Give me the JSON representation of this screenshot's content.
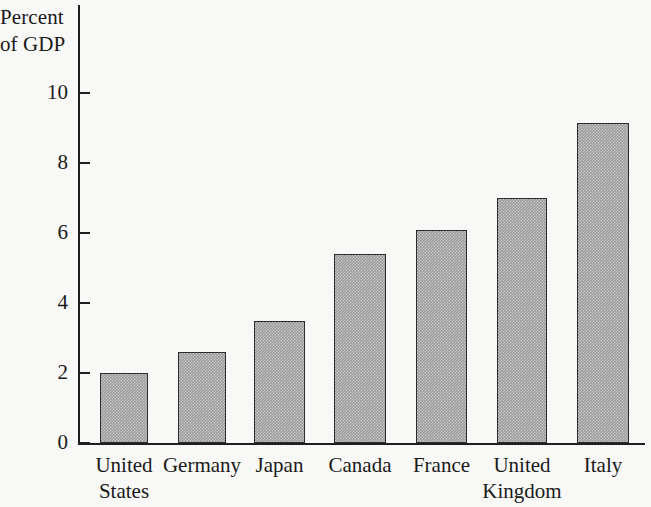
{
  "chart_data": {
    "type": "bar",
    "title": "",
    "subtitle": "",
    "xlabel": "",
    "ylabel": "Percent of GDP",
    "ylabel_lines": [
      "Percent",
      "of GDP"
    ],
    "categories": [
      "United States",
      "Germany",
      "Japan",
      "Canada",
      "France",
      "United Kingdom",
      "Italy"
    ],
    "category_lines": [
      [
        "United",
        "States"
      ],
      [
        "Germany"
      ],
      [
        "Japan"
      ],
      [
        "Canada"
      ],
      [
        "France"
      ],
      [
        "United",
        "Kingdom"
      ],
      [
        "Italy"
      ]
    ],
    "values": [
      2.0,
      2.6,
      3.5,
      5.4,
      6.1,
      7.0,
      9.15
    ],
    "ylim": [
      0,
      10.6
    ],
    "yticks": [
      0,
      2,
      4,
      6,
      8,
      10
    ],
    "ytick_labels": [
      "0",
      "2",
      "4",
      "6",
      "8",
      "10"
    ],
    "grid": false,
    "legend": null,
    "bar_fill_color": "#9b9b9b",
    "bar_edge_color": "#2b2b2b",
    "axis_color": "#1f1f1f",
    "background_color": "#f8f8f7"
  }
}
